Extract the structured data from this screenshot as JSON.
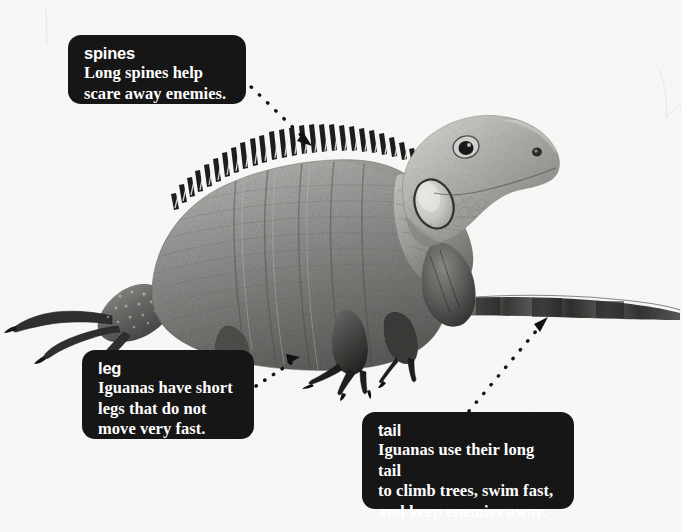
{
  "page": {
    "subject": "iguana",
    "background_color": "#f7f7f5",
    "callout_bg_color": "#161616",
    "callout_text_color": "#ffffff",
    "leader_color": "#111111"
  },
  "photo": {
    "alt": "grayscale photograph of an iguana in profile facing right",
    "description": "Large iguana standing in profile, facing right, with a long tapering tail extending to the right edge, a row of tall spines along its back, short legs with long claws, and a round ear disc on the side of the head."
  },
  "callouts": [
    {
      "id": "spines",
      "heading": "spines",
      "body": "Long spines help\nscare away enemies."
    },
    {
      "id": "leg",
      "heading": "leg",
      "body": "Iguanas have short\nlegs that do not\nmove very fast."
    },
    {
      "id": "tail",
      "heading": "tail",
      "body": "Iguanas use their long tail\nto climb trees, swim fast,\nand keep enemies away."
    }
  ],
  "leaders": [
    {
      "id": "spines-leader",
      "from": [
        243,
        79
      ],
      "to": [
        312,
        146
      ],
      "points_at": "dorsal-spines"
    },
    {
      "id": "leg-leader",
      "from": [
        256,
        386
      ],
      "to": [
        300,
        357
      ],
      "points_at": "hind-leg"
    },
    {
      "id": "tail-leader",
      "from": [
        469,
        411
      ],
      "to": [
        548,
        317
      ],
      "points_at": "tail"
    }
  ]
}
